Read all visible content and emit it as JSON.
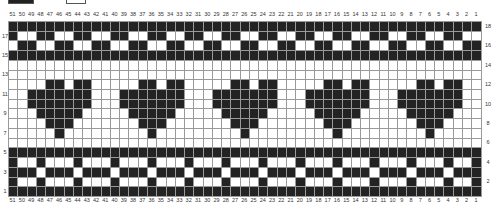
{
  "legend": {
    "items": [
      {
        "name": "contrast-color-square",
        "color": "#232323"
      },
      {
        "name": "main-color-square",
        "color": "#ffffff"
      }
    ]
  },
  "chart": {
    "columns": 51,
    "rows": 18,
    "column_labels_left_to_right": [
      51,
      50,
      49,
      48,
      47,
      46,
      45,
      44,
      43,
      42,
      41,
      40,
      39,
      38,
      37,
      36,
      35,
      34,
      33,
      32,
      31,
      30,
      29,
      28,
      27,
      26,
      25,
      24,
      23,
      22,
      21,
      20,
      19,
      18,
      17,
      16,
      15,
      14,
      13,
      12,
      11,
      10,
      9,
      8,
      7,
      6,
      5,
      4,
      3,
      2,
      1
    ],
    "left_row_labels": [
      17,
      15,
      13,
      11,
      9,
      7,
      5,
      3,
      1
    ],
    "right_row_labels": [
      18,
      16,
      14,
      12,
      10,
      8,
      6,
      4,
      2
    ],
    "colors": {
      "filled": "#232323",
      "empty": "#ffffff",
      "gridline": "#9a9a9a"
    },
    "rows_top_to_bottom": [
      "###################################################",
      "#..##..##..##..##..##..##..##..##..##..##..##..##..",
      ".##..##..##..##..##..##..##..##..##..##..##..##..##",
      "###################################################",
      "...................................................",
      "...................................................",
      "....##.##.....##.##.....##.##.....##.##.....##.##..",
      "..#######...#######...#######...#######...#######..",
      "..#######...#######...#######...#######...#######..",
      "...#####.....#####.....#####.....#####.....#####...",
      "....###.......###.......###.......###.......###....",
      ".....#.........#.........#.........#.........#.....",
      "...................................................",
      "###################################################",
      "#..#...#...#...#...#...#...#...#...#...#...#...#..#",
      "###.###.###.###.###.###.###.###.###.###.###.###.###",
      "#..#...#...#...#...#...#...#...#...#...#...#...#..#",
      "###################################################"
    ]
  }
}
